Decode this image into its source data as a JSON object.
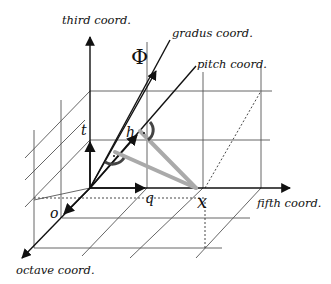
{
  "diagram": {
    "type": "3d-coordinate-diagram",
    "axes": {
      "third": "third coord.",
      "fifth": "fifth coord.",
      "octave": "octave coord.",
      "gradus": "gradus coord.",
      "pitch": "pitch coord."
    },
    "symbols": {
      "phi": "Φ",
      "t": "t",
      "h": "h",
      "q": "q",
      "o": "o",
      "x": "x"
    },
    "colors": {
      "axis": "#111111",
      "grid": "#555555",
      "projection": "#aaaaaa",
      "angle_mark": "#444444"
    }
  }
}
